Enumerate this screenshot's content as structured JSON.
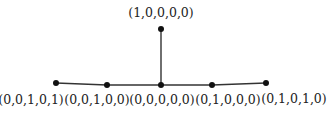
{
  "diagram": {
    "type": "tree",
    "nodes": [
      {
        "id": "n_top",
        "label": "(1,0,0,0,0)",
        "x": 161,
        "y": 29,
        "label_x": 161,
        "label_y": 17
      },
      {
        "id": "n1",
        "label": "(0,0,1,0,1)",
        "x": 56,
        "y": 83,
        "label_x": 31,
        "label_y": 104
      },
      {
        "id": "n2",
        "label": "(0,0,1,0,0)",
        "x": 107,
        "y": 85,
        "label_x": 97,
        "label_y": 104
      },
      {
        "id": "n_center",
        "label": "(0,0,0,0,0)",
        "x": 161,
        "y": 85,
        "label_x": 162,
        "label_y": 104
      },
      {
        "id": "n4",
        "label": "(0,1,0,0,0)",
        "x": 212,
        "y": 85,
        "label_x": 228,
        "label_y": 104
      },
      {
        "id": "n5",
        "label": "(0,1,0,1,0)",
        "x": 266,
        "y": 83,
        "label_x": 294,
        "label_y": 103
      }
    ],
    "edges": [
      {
        "from": "n1",
        "to": "n2"
      },
      {
        "from": "n2",
        "to": "n_center"
      },
      {
        "from": "n_center",
        "to": "n4"
      },
      {
        "from": "n4",
        "to": "n5"
      },
      {
        "from": "n_center",
        "to": "n_top"
      }
    ]
  }
}
